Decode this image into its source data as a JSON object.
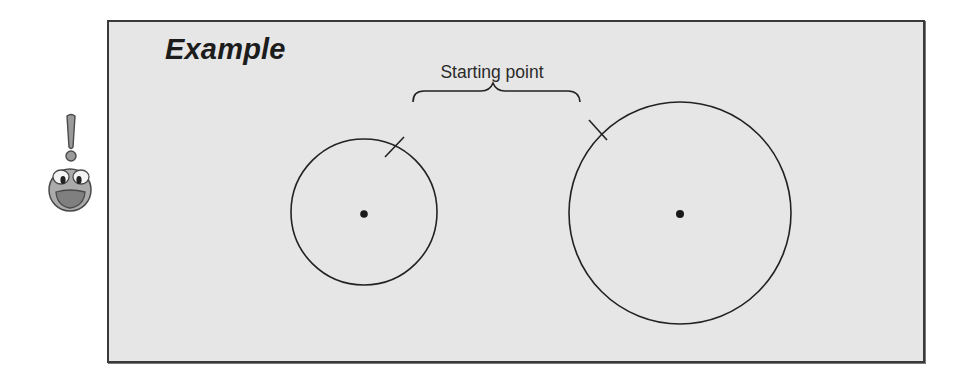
{
  "diagram": {
    "title": "Example",
    "annotation": "Starting point",
    "mascot": {
      "icon": "exclamation-smiley-icon",
      "description": "cartoon face with exclamation mark"
    },
    "shapes": [
      {
        "id": "small-circle",
        "type": "circle",
        "center_marker": "dot",
        "start_tick": "upper-right"
      },
      {
        "id": "large-circle",
        "type": "circle",
        "center_marker": "dot",
        "start_tick": "upper-left"
      }
    ],
    "brace": {
      "points_to": [
        "small-circle.start_tick",
        "large-circle.start_tick"
      ]
    }
  },
  "colors": {
    "panel_background": "#e6e6e6",
    "panel_border": "#3a3a3a",
    "stroke": "#222222",
    "mascot_face": "#a9a9a9",
    "mascot_mouth": "#8c8c8c"
  }
}
